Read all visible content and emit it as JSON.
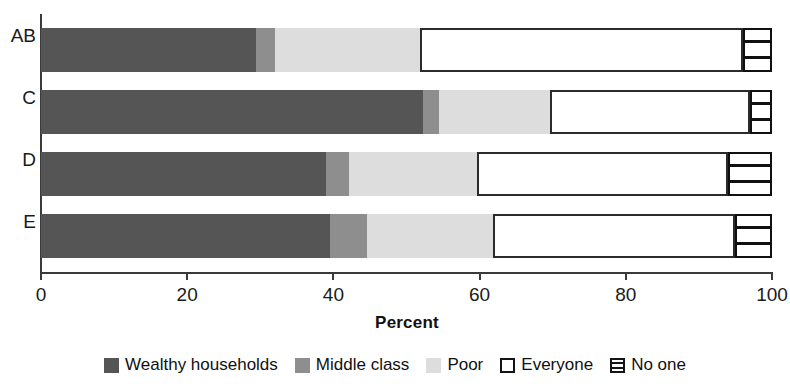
{
  "chart_data": {
    "type": "bar",
    "orientation": "horizontal",
    "stacked": true,
    "stack_unit": "percent",
    "title": "",
    "xlabel": "Percent",
    "ylabel": "",
    "xlim": [
      0,
      100
    ],
    "xticks": [
      0,
      20,
      40,
      60,
      80,
      100
    ],
    "xtick_labels": [
      "0",
      "20",
      "40",
      "60",
      "80",
      "100"
    ],
    "grid": false,
    "legend_position": "bottom",
    "categories": [
      "AB",
      "C",
      "D",
      "E"
    ],
    "series": [
      {
        "name": "Wealthy households",
        "color": "#555555",
        "values": [
          29.4,
          52.3,
          39.0,
          39.5
        ]
      },
      {
        "name": "Middle class",
        "color": "#8e8e8e",
        "values": [
          2.6,
          2.1,
          3.1,
          5.1
        ]
      },
      {
        "name": "Poor",
        "color": "#dddddd",
        "values": [
          19.8,
          15.2,
          17.5,
          17.2
        ]
      },
      {
        "name": "Everyone",
        "color": "#ffffff",
        "values": [
          44.2,
          27.5,
          34.5,
          33.1
        ]
      },
      {
        "name": "No one",
        "color": "#ffffff",
        "values": [
          4.0,
          3.0,
          6.0,
          5.2
        ]
      }
    ],
    "rows": [
      {
        "label": "AB",
        "segments": [
          {
            "name": "Wealthy households",
            "value": 29.4,
            "start": 0.0,
            "end": 29.4
          },
          {
            "name": "Middle class",
            "value": 2.6,
            "start": 29.4,
            "end": 32.0
          },
          {
            "name": "Poor",
            "value": 19.8,
            "start": 32.0,
            "end": 51.8
          },
          {
            "name": "Everyone",
            "value": 44.2,
            "start": 51.8,
            "end": 96.0
          },
          {
            "name": "No one",
            "value": 4.0,
            "start": 96.0,
            "end": 100.0
          }
        ]
      },
      {
        "label": "C",
        "segments": [
          {
            "name": "Wealthy households",
            "value": 52.3,
            "start": 0.0,
            "end": 52.3
          },
          {
            "name": "Middle class",
            "value": 2.1,
            "start": 52.3,
            "end": 54.4
          },
          {
            "name": "Poor",
            "value": 15.2,
            "start": 54.4,
            "end": 69.6
          },
          {
            "name": "Everyone",
            "value": 27.5,
            "start": 69.6,
            "end": 97.0
          },
          {
            "name": "No one",
            "value": 3.0,
            "start": 97.0,
            "end": 100.0
          }
        ]
      },
      {
        "label": "D",
        "segments": [
          {
            "name": "Wealthy households",
            "value": 39.0,
            "start": 0.0,
            "end": 39.0
          },
          {
            "name": "Middle class",
            "value": 3.1,
            "start": 39.0,
            "end": 42.1
          },
          {
            "name": "Poor",
            "value": 17.5,
            "start": 42.1,
            "end": 59.6
          },
          {
            "name": "Everyone",
            "value": 34.5,
            "start": 59.6,
            "end": 94.0
          },
          {
            "name": "No one",
            "value": 6.0,
            "start": 94.0,
            "end": 100.0
          }
        ]
      },
      {
        "label": "E",
        "segments": [
          {
            "name": "Wealthy households",
            "value": 39.5,
            "start": 0.0,
            "end": 39.5
          },
          {
            "name": "Middle class",
            "value": 5.1,
            "start": 39.5,
            "end": 44.6
          },
          {
            "name": "Poor",
            "value": 17.2,
            "start": 44.6,
            "end": 61.8
          },
          {
            "name": "Everyone",
            "value": 33.1,
            "start": 61.8,
            "end": 94.9
          },
          {
            "name": "No one",
            "value": 5.2,
            "start": 94.9,
            "end": 100.0
          }
        ]
      }
    ]
  },
  "axis": {
    "x_title": "Percent",
    "y_labels": [
      "AB",
      "C",
      "D",
      "E"
    ],
    "x_tick_labels": [
      "0",
      "20",
      "40",
      "60",
      "80",
      "100"
    ]
  },
  "legend": {
    "items": [
      {
        "label": "Wealthy households",
        "swatch": "solid-dark-gray-swatch"
      },
      {
        "label": "Middle class",
        "swatch": "solid-medium-gray-swatch"
      },
      {
        "label": "Poor",
        "swatch": "solid-light-gray-swatch"
      },
      {
        "label": "Everyone",
        "swatch": "outlined-white-swatch"
      },
      {
        "label": "No one",
        "swatch": "hatched-horizontal-lines-swatch"
      }
    ]
  }
}
